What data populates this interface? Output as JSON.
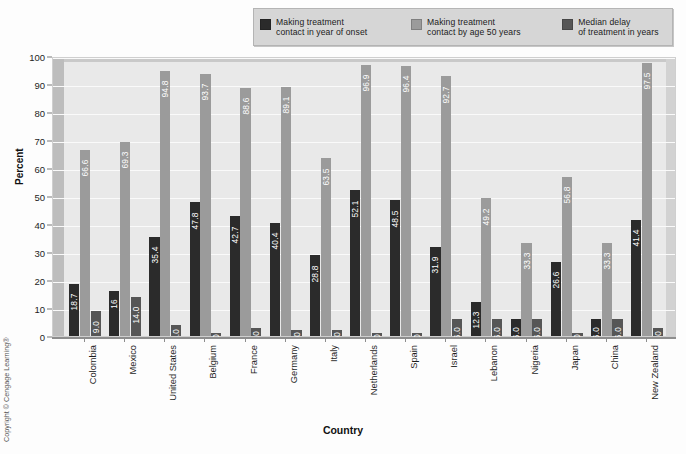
{
  "chart_data": {
    "type": "bar",
    "title": "",
    "xlabel": "Country",
    "ylabel": "Percent",
    "ylim": [
      0,
      100
    ],
    "yticks": [
      0,
      10,
      20,
      30,
      40,
      50,
      60,
      70,
      80,
      90,
      100
    ],
    "grid": true,
    "legend_position": "top",
    "categories": [
      "Colombia",
      "Mexico",
      "United States",
      "Belgium",
      "France",
      "Germany",
      "Italy",
      "Netherlands",
      "Spain",
      "Israel",
      "Lebanon",
      "Nigeria",
      "Japan",
      "China",
      "New Zealand"
    ],
    "series": [
      {
        "name": "Making treatment contact in year of onset",
        "color": "#2b2b2b",
        "values": [
          18.7,
          16,
          35.4,
          47.8,
          42.7,
          40.4,
          28.8,
          52.1,
          48.5,
          31.9,
          12.3,
          6.0,
          26.6,
          6.0,
          41.4
        ],
        "labels": [
          "18.7",
          "16",
          "35.4",
          "47.8",
          "42.7",
          "40.4",
          "28.8",
          "52.1",
          "48.5",
          "31.9",
          "12.3",
          "6.0",
          "26.6",
          "6.0",
          "41.4"
        ]
      },
      {
        "name": "Making treatment contact by age 50 years",
        "color": "#9b9b9b",
        "values": [
          66.6,
          69.3,
          94.8,
          93.7,
          88.6,
          89.1,
          63.5,
          96.9,
          96.4,
          92.7,
          49.2,
          33.3,
          56.8,
          33.3,
          97.5
        ],
        "labels": [
          "66.6",
          "69.3",
          "94.8",
          "93.7",
          "88.6",
          "89.1",
          "63.5",
          "96.9",
          "96.4",
          "92.7",
          "49.2",
          "33.3",
          "56.8",
          "33.3",
          "97.5"
        ]
      },
      {
        "name": "Median delay of treatment in years",
        "color": "#565656",
        "values": [
          9.0,
          14.0,
          4.0,
          1.0,
          3.0,
          2.0,
          2.0,
          1.0,
          1.0,
          6.0,
          6.0,
          6.0,
          1.0,
          6.0,
          3.0
        ],
        "labels": [
          "9.0",
          "14.0",
          "4.0",
          "1.0",
          "3.0",
          "2.0",
          "2.0",
          "1.0",
          "1.0",
          "6.0",
          "6.0",
          "6.0",
          "1.0",
          "6.0",
          "3.0"
        ]
      }
    ]
  },
  "legend": {
    "items": [
      {
        "line1": "Making treatment",
        "line2": "contact in year of onset",
        "color": "#2b2b2b"
      },
      {
        "line1": "Making treatment",
        "line2": "contact by age 50 years",
        "color": "#9b9b9b"
      },
      {
        "line1": "Median delay",
        "line2": "of treatment in years",
        "color": "#565656"
      }
    ]
  },
  "axes": {
    "y_title": "Percent",
    "x_title": "Country"
  },
  "footer": {
    "copyright": "Copyright © Cengage Learning®"
  }
}
